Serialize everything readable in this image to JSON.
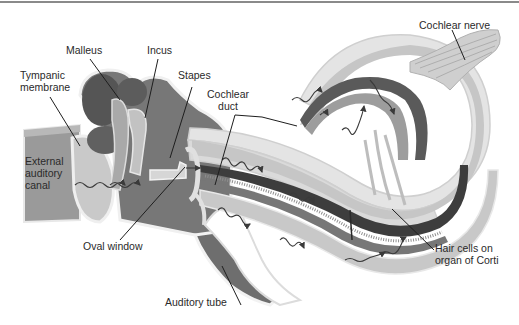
{
  "figure": {
    "labels": {
      "malleus": "Malleus",
      "incus": "Incus",
      "stapes": "Stapes",
      "tympanic_membrane": "Tympanic\nmembrane",
      "cochlear_duct": "Cochlear\nduct",
      "cochlear_nerve": "Cochlear nerve",
      "external_auditory_canal": "External\nauditory\ncanal",
      "oval_window": "Oval window",
      "auditory_tube": "Auditory tube",
      "hair_cells": "Hair cells on\norgan of Corti"
    },
    "colors": {
      "dark_tissue": "#5a5a5a",
      "mid_tissue": "#8c8c8c",
      "light_tissue": "#c4c4c4",
      "pale_tissue": "#dedede",
      "membrane": "#ececec",
      "leader_line": "#1e1e1e"
    }
  }
}
